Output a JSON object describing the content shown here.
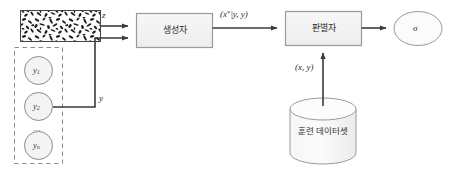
{
  "diagram": {
    "background_color": "#ffffff",
    "stroke_color": "#555555",
    "arrow_color": "#3a3a3a",
    "box_fill": "#f2f2f2",
    "box_stroke": "#9a9a9a",
    "dashed_stroke": "#8c8c8c",
    "nodes": {
      "noise_block": {
        "name": "noise-texture-block",
        "label": ""
      },
      "label_group": {
        "name": "label-set-group",
        "items": [
          {
            "label": "y",
            "subscript": "1"
          },
          {
            "label": "y",
            "subscript": "2"
          },
          {
            "label": "y",
            "subscript": "n"
          }
        ],
        "ellipsis": "..."
      },
      "generator": {
        "name": "generator-box",
        "label": "생성자"
      },
      "discriminator": {
        "name": "discriminator-box",
        "label": "판별자"
      },
      "output": {
        "name": "sigma-output-ellipse",
        "label": "σ"
      },
      "dataset": {
        "name": "training-dataset-cylinder",
        "label": "훈련 데이터셋"
      }
    },
    "edge_labels": {
      "noise_to_generator": "z",
      "labels_to_generator": "y",
      "generator_to_discriminator_prefix": "(x",
      "generator_to_discriminator_sup": "*",
      "generator_to_discriminator_suffix": "|y, y)",
      "dataset_to_discriminator": "(x, y)"
    }
  }
}
